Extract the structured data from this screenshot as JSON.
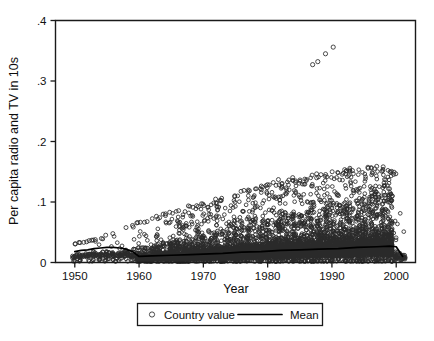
{
  "chart_data": {
    "type": "scatter",
    "title": "",
    "xlabel": "Year",
    "ylabel": "Per capita radio and TV in 10s",
    "xlim": [
      1947,
      2003
    ],
    "ylim": [
      0,
      0.4
    ],
    "xticks": [
      1950,
      1960,
      1970,
      1980,
      1990,
      2000
    ],
    "xticklabels": [
      "1950",
      "1960",
      "1970",
      "1980",
      "1990",
      "2000"
    ],
    "yticks": [
      0,
      0.1,
      0.2,
      0.3,
      0.4
    ],
    "yticklabels": [
      "0",
      ".1",
      ".2",
      ".3",
      ".4"
    ],
    "grid": false,
    "frame": true,
    "legend": {
      "position": "below-axes",
      "entries": [
        {
          "label": "Country value",
          "marker": "open-circle",
          "color": "#2b2b2b"
        },
        {
          "label": "Mean",
          "marker": "line",
          "color": "#000000"
        }
      ]
    },
    "series": [
      {
        "name": "Country value",
        "type": "scatter",
        "marker": "open-circle",
        "color": "#2b2b2b",
        "description": "Per-country per capita radio and TV ownership, one open circle per country-year, 1950-2001. Dense cloud near zero widening over time, upper envelope trail rising from about 0.03 in 1950 to about 0.16 by 1995, plus a small outlier cluster near 0.33-0.36 around 1987-1991.",
        "envelope_upper": [
          {
            "x": 1950,
            "y": 0.032
          },
          {
            "x": 1952,
            "y": 0.036
          },
          {
            "x": 1954,
            "y": 0.04
          },
          {
            "x": 1956,
            "y": 0.05
          },
          {
            "x": 1958,
            "y": 0.058
          },
          {
            "x": 1960,
            "y": 0.066
          },
          {
            "x": 1962,
            "y": 0.073
          },
          {
            "x": 1964,
            "y": 0.08
          },
          {
            "x": 1966,
            "y": 0.086
          },
          {
            "x": 1968,
            "y": 0.093
          },
          {
            "x": 1970,
            "y": 0.098
          },
          {
            "x": 1972,
            "y": 0.104
          },
          {
            "x": 1974,
            "y": 0.112
          },
          {
            "x": 1976,
            "y": 0.118
          },
          {
            "x": 1978,
            "y": 0.124
          },
          {
            "x": 1980,
            "y": 0.13
          },
          {
            "x": 1982,
            "y": 0.136
          },
          {
            "x": 1984,
            "y": 0.14
          },
          {
            "x": 1986,
            "y": 0.143
          },
          {
            "x": 1988,
            "y": 0.147
          },
          {
            "x": 1990,
            "y": 0.152
          },
          {
            "x": 1992,
            "y": 0.155
          },
          {
            "x": 1994,
            "y": 0.157
          },
          {
            "x": 1996,
            "y": 0.158
          },
          {
            "x": 1998,
            "y": 0.158
          },
          {
            "x": 2000,
            "y": 0.15
          }
        ],
        "envelope_bulk": [
          {
            "x": 1950,
            "y": 0.014
          },
          {
            "x": 1955,
            "y": 0.018
          },
          {
            "x": 1960,
            "y": 0.024
          },
          {
            "x": 1965,
            "y": 0.034
          },
          {
            "x": 1970,
            "y": 0.044
          },
          {
            "x": 1975,
            "y": 0.056
          },
          {
            "x": 1980,
            "y": 0.068
          },
          {
            "x": 1985,
            "y": 0.08
          },
          {
            "x": 1990,
            "y": 0.092
          },
          {
            "x": 1995,
            "y": 0.104
          },
          {
            "x": 1999,
            "y": 0.112
          },
          {
            "x": 2001,
            "y": 0.03
          }
        ],
        "outliers": [
          {
            "x": 1987,
            "y": 0.327
          },
          {
            "x": 1987.8,
            "y": 0.332
          },
          {
            "x": 1989,
            "y": 0.345
          },
          {
            "x": 1990.2,
            "y": 0.356
          }
        ]
      },
      {
        "name": "Mean",
        "type": "line",
        "color": "#000000",
        "points": [
          {
            "x": 1950,
            "y": 0.018
          },
          {
            "x": 1951,
            "y": 0.02
          },
          {
            "x": 1952,
            "y": 0.021
          },
          {
            "x": 1953,
            "y": 0.023
          },
          {
            "x": 1954,
            "y": 0.024
          },
          {
            "x": 1955,
            "y": 0.025
          },
          {
            "x": 1956,
            "y": 0.025
          },
          {
            "x": 1957,
            "y": 0.024
          },
          {
            "x": 1958,
            "y": 0.022
          },
          {
            "x": 1959,
            "y": 0.018
          },
          {
            "x": 1960,
            "y": 0.01
          },
          {
            "x": 1962,
            "y": 0.011
          },
          {
            "x": 1965,
            "y": 0.012
          },
          {
            "x": 1968,
            "y": 0.013
          },
          {
            "x": 1970,
            "y": 0.014
          },
          {
            "x": 1973,
            "y": 0.015
          },
          {
            "x": 1976,
            "y": 0.017
          },
          {
            "x": 1979,
            "y": 0.018
          },
          {
            "x": 1982,
            "y": 0.02
          },
          {
            "x": 1985,
            "y": 0.021
          },
          {
            "x": 1988,
            "y": 0.022
          },
          {
            "x": 1991,
            "y": 0.023
          },
          {
            "x": 1994,
            "y": 0.025
          },
          {
            "x": 1997,
            "y": 0.026
          },
          {
            "x": 1999,
            "y": 0.027
          },
          {
            "x": 2000,
            "y": 0.026
          },
          {
            "x": 2001,
            "y": 0.01
          }
        ]
      }
    ]
  }
}
